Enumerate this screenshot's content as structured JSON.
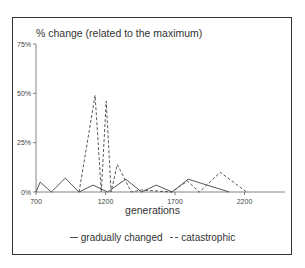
{
  "chart_data": {
    "type": "line",
    "title": "% change (related to the maximum)",
    "xlabel": "generations",
    "ylabel": "% change (related to the maximum)",
    "xlim": [
      700,
      2400
    ],
    "ylim": [
      0,
      75
    ],
    "x_ticks": [
      "700",
      "1200",
      "1700",
      "2200"
    ],
    "y_ticks": [
      "0%",
      "25%",
      "50%",
      "75%"
    ],
    "grid": false,
    "legend_position": "bottom",
    "series": [
      {
        "name": "gradually changed",
        "style": "solid",
        "points": [
          [
            700,
            0
          ],
          [
            730,
            5
          ],
          [
            810,
            0
          ],
          [
            910,
            7
          ],
          [
            1010,
            0
          ],
          [
            1110,
            3.5
          ],
          [
            1215,
            0
          ],
          [
            1345,
            6.5
          ],
          [
            1460,
            0
          ],
          [
            1565,
            3.5
          ],
          [
            1680,
            0
          ],
          [
            1795,
            6.5
          ],
          [
            2090,
            0
          ]
        ]
      },
      {
        "name": "catastrophic",
        "style": "dashed",
        "points": [
          [
            1010,
            0
          ],
          [
            1125,
            49
          ],
          [
            1170,
            0
          ],
          [
            1205,
            46
          ],
          [
            1240,
            0
          ],
          [
            1285,
            14
          ],
          [
            1385,
            0
          ],
          [
            1460,
            1
          ],
          [
            1675,
            0
          ],
          [
            1790,
            5.5
          ],
          [
            1875,
            0
          ],
          [
            2025,
            10
          ],
          [
            2215,
            0
          ]
        ]
      }
    ]
  },
  "labels": {
    "title": "% change (related to the maximum)",
    "xlabel": "generations",
    "legend": [
      {
        "label": "gradually changed",
        "style": "solid"
      },
      {
        "label": "catastrophic",
        "style": "dashed"
      }
    ]
  }
}
